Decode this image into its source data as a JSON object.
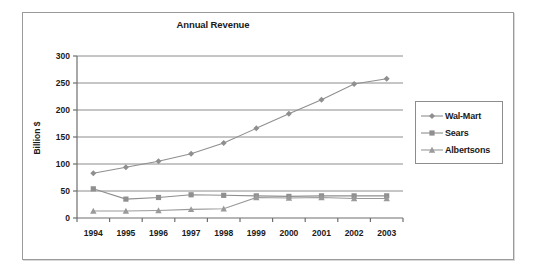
{
  "chart_data": {
    "type": "line",
    "title": "Annual Revenue",
    "xlabel": "",
    "ylabel": "Billion $",
    "categories": [
      "1994",
      "1995",
      "1996",
      "1997",
      "1998",
      "1999",
      "2000",
      "2001",
      "2002",
      "2003"
    ],
    "ylim": [
      0,
      300
    ],
    "yticks": [
      0,
      50,
      100,
      150,
      200,
      250,
      300
    ],
    "ytick_labels": [
      "0",
      "50",
      "100",
      "150",
      "200",
      "250",
      "300"
    ],
    "grid": true,
    "legend_position": "right",
    "series": [
      {
        "name": "Wal-Mart",
        "marker": "diamond",
        "color": "#8f8f8f",
        "values": [
          83,
          94,
          105,
          119,
          139,
          166,
          193,
          219,
          248,
          258
        ]
      },
      {
        "name": "Sears",
        "marker": "square",
        "color": "#8f8f8f",
        "values": [
          54,
          35,
          38,
          43,
          42,
          41,
          40,
          41,
          41,
          41
        ]
      },
      {
        "name": "Albertsons",
        "marker": "triangle",
        "color": "#9a9a9a",
        "values": [
          13,
          13,
          14,
          16,
          17,
          38,
          37,
          38,
          36,
          36
        ]
      }
    ]
  },
  "colors": {
    "frame_border": "#9a9a9a",
    "axis": "#6e6e6e",
    "gridline": "#8c8c8c",
    "text": "#1a1a1a",
    "plot_background": "#ffffff"
  }
}
